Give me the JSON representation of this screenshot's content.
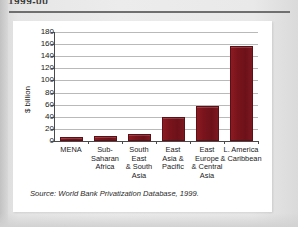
{
  "page": {
    "cut_heading": "1999-00",
    "background_color": "#e6e6e6",
    "card_color": "#ffffff"
  },
  "source_note": "Source: World Bank Privatization Database, 1999.",
  "chart_data": {
    "type": "bar",
    "title": "",
    "xlabel": "",
    "ylabel": "$ billion",
    "ylim": [
      0,
      180
    ],
    "ytick_step": 20,
    "yticks": [
      0,
      20,
      40,
      60,
      80,
      100,
      120,
      140,
      160,
      180
    ],
    "ytick_labels": [
      "0",
      "20",
      "40",
      "60",
      "80",
      "100",
      "120",
      "140",
      "160",
      "180"
    ],
    "grid": true,
    "legend": "none",
    "bar_color": "#7a141c",
    "categories": [
      "MENA",
      "Sub-Saharan\nAfrica",
      "South\nEast\n& South\nAsia",
      "East\nAsia &\nPacific",
      "East\nEurope\n& Central\nAsia",
      "L. America\n& Caribbean"
    ],
    "values": [
      7,
      9,
      12,
      40,
      57,
      157
    ]
  }
}
